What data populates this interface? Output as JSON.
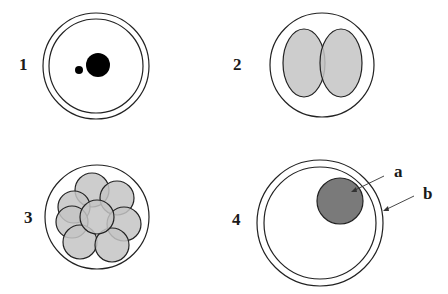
{
  "figure": {
    "panels": [
      {
        "id": "1",
        "label": "1",
        "description": "fertilized egg with two pronuclei inside double membrane"
      },
      {
        "id": "2",
        "label": "2",
        "description": "two-cell stage"
      },
      {
        "id": "3",
        "label": "3",
        "description": "eight-cell stage (morula)"
      },
      {
        "id": "4",
        "label": "4",
        "description": "blastocyst with inner cell mass"
      }
    ],
    "annotations": [
      {
        "id": "a",
        "label": "a"
      },
      {
        "id": "b",
        "label": "b"
      }
    ],
    "colors": {
      "outline": "#222222",
      "cell_fill": "#c4c4c4",
      "inner_mass_fill": "#7a7a7a",
      "nucleus_fill": "#000000"
    }
  }
}
